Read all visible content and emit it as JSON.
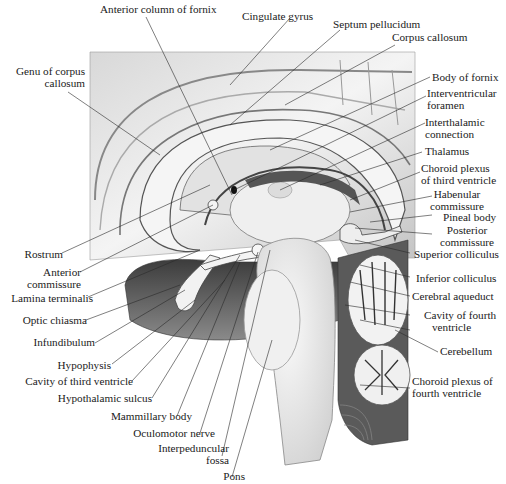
{
  "diagram": {
    "colors": {
      "background": "#ffffff",
      "tissue_light": "#f2f2f2",
      "tissue_mid": "#c9c9c9",
      "tissue_dark": "#5a5a5a",
      "cavity": "#4a4a4a",
      "line": "#2a2a2a"
    },
    "labels": {
      "top": [
        {
          "id": "anterior-column-of-fornix",
          "text": [
            "Anterior column of fornix"
          ]
        },
        {
          "id": "cingulate-gyrus",
          "text": [
            "Cingulate gyrus"
          ]
        },
        {
          "id": "septum-pellucidum",
          "text": [
            "Septum pellucidum"
          ]
        },
        {
          "id": "corpus-callosum",
          "text": [
            "Corpus callosum"
          ]
        }
      ],
      "left": [
        {
          "id": "genu-of-corpus-callosum",
          "text": [
            "Genu of corpus",
            "callosum"
          ]
        },
        {
          "id": "rostrum",
          "text": [
            "Rostrum"
          ]
        },
        {
          "id": "anterior-commissure",
          "text": [
            "Anterior",
            "commissure"
          ]
        },
        {
          "id": "lamina-terminalis",
          "text": [
            "Lamina terminalis"
          ]
        },
        {
          "id": "optic-chiasma",
          "text": [
            "Optic chiasma"
          ]
        },
        {
          "id": "infundibulum",
          "text": [
            "Infundibulum"
          ]
        },
        {
          "id": "hypophysis",
          "text": [
            "Hypophysis"
          ]
        },
        {
          "id": "cavity-of-third-ventricle",
          "text": [
            "Cavity of third ventricle"
          ]
        },
        {
          "id": "hypothalamic-sulcus",
          "text": [
            "Hypothalamic sulcus"
          ]
        },
        {
          "id": "mammillary-body",
          "text": [
            "Mammillary body"
          ]
        },
        {
          "id": "oculomotor-nerve",
          "text": [
            "Oculomotor nerve"
          ]
        },
        {
          "id": "interpeduncular-fossa",
          "text": [
            "Interpeduncular",
            "fossa"
          ]
        },
        {
          "id": "pons",
          "text": [
            "Pons"
          ]
        }
      ],
      "right": [
        {
          "id": "body-of-fornix",
          "text": [
            "Body of fornix"
          ]
        },
        {
          "id": "interventricular-foramen",
          "text": [
            "Interventricular",
            "foramen"
          ]
        },
        {
          "id": "interthalamic-connection",
          "text": [
            "Interthalamic",
            "connection"
          ]
        },
        {
          "id": "thalamus",
          "text": [
            "Thalamus"
          ]
        },
        {
          "id": "choroid-plexus-of-third-ventricle",
          "text": [
            "Choroid plexus",
            "of third ventricle"
          ]
        },
        {
          "id": "habenular-commissure",
          "text": [
            "Habenular",
            "commissure"
          ]
        },
        {
          "id": "pineal-body",
          "text": [
            "Pineal body"
          ]
        },
        {
          "id": "posterior-commissure",
          "text": [
            "Posterior",
            "commissure"
          ]
        },
        {
          "id": "superior-colliculus",
          "text": [
            "Superior colliculus"
          ]
        },
        {
          "id": "inferior-colliculus",
          "text": [
            "Inferior colliculus"
          ]
        },
        {
          "id": "cerebral-aqueduct",
          "text": [
            "Cerebral aqueduct"
          ]
        },
        {
          "id": "cavity-of-fourth-ventricle",
          "text": [
            "Cavity of fourth",
            "ventricle"
          ]
        },
        {
          "id": "cerebellum",
          "text": [
            "Cerebellum"
          ]
        },
        {
          "id": "choroid-plexus-of-fourth-ventricle",
          "text": [
            "Choroid plexus of",
            "fourth ventricle"
          ]
        }
      ]
    }
  }
}
